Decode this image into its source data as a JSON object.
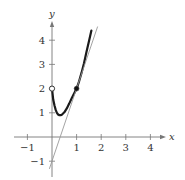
{
  "chart_data": {
    "type": "line",
    "title": "",
    "xlabel": "x",
    "ylabel": "y",
    "xlim": [
      -1.4,
      4.6
    ],
    "ylim": [
      -1.4,
      4.6
    ],
    "grid": false,
    "legend": null,
    "x_ticks": [
      -1,
      1,
      2,
      3,
      4
    ],
    "y_ticks": [
      -1,
      1,
      2,
      3,
      4
    ],
    "x_tick_labels": [
      "−1",
      "1",
      "2",
      "3",
      "4"
    ],
    "y_tick_labels": [
      "−1",
      "1",
      "2",
      "3",
      "4"
    ],
    "series": [
      {
        "name": "curve",
        "style": "thick-black",
        "x": [
          0,
          0.05,
          0.1,
          0.15,
          0.2,
          0.25,
          0.3,
          0.35,
          0.4,
          0.5,
          0.6,
          0.7,
          0.8,
          0.9,
          1.0,
          1.1,
          1.2,
          1.3,
          1.4,
          1.5,
          1.6
        ],
        "y": [
          2.0,
          1.55,
          1.3,
          1.12,
          1.0,
          0.93,
          0.9,
          0.9,
          0.92,
          1.02,
          1.18,
          1.38,
          1.6,
          1.8,
          2.0,
          2.3,
          2.65,
          3.05,
          3.5,
          3.95,
          4.4
        ]
      },
      {
        "name": "tangent line",
        "style": "thin-gray",
        "x": [
          -0.1,
          1.85
        ],
        "y": [
          -1.3,
          4.55
        ],
        "equation": "y = 3x - 1"
      }
    ],
    "points": [
      {
        "x": 0,
        "y": 2,
        "style": "open",
        "label": "open circle"
      },
      {
        "x": 1,
        "y": 2,
        "style": "filled",
        "label": "point of tangency"
      }
    ]
  }
}
